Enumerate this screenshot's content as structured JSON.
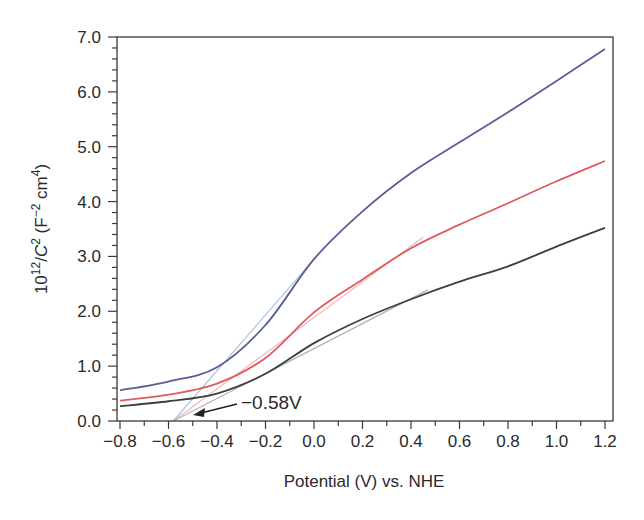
{
  "chart_data": {
    "type": "line",
    "title": "",
    "xlabel": "Potential (V) vs. NHE",
    "ylabel": {
      "base": "10",
      "exp": "12",
      "mid": "/",
      "var": "C",
      "var_exp": "2",
      "units_open": " (F",
      "units_exp1": "−2",
      "units_mid": " cm",
      "units_exp2": "4",
      "units_close": ")"
    },
    "xlim": [
      -0.85,
      1.23
    ],
    "ylim": [
      0.0,
      7.0
    ],
    "x_ticks": [
      -0.8,
      -0.6,
      -0.4,
      -0.2,
      0.0,
      0.2,
      0.4,
      0.6,
      0.8,
      1.0,
      1.2
    ],
    "x_tick_labels": [
      "−0.8",
      "−0.6",
      "−0.4",
      "−0.2",
      "0.0",
      "0.2",
      "0.4",
      "0.6",
      "0.8",
      "1.0",
      "1.2"
    ],
    "x_minor_step": 0.1,
    "y_ticks": [
      0,
      1,
      2,
      3,
      4,
      5,
      6,
      7
    ],
    "y_tick_labels": [
      "0.0",
      "1.0",
      "2.0",
      "3.0",
      "4.0",
      "5.0",
      "6.0",
      "7.0"
    ],
    "y_minor_step": 0.2,
    "grid": false,
    "legend": null,
    "x": [
      -0.8,
      -0.6,
      -0.4,
      -0.2,
      0.0,
      0.2,
      0.4,
      0.6,
      0.8,
      1.0,
      1.2
    ],
    "series": [
      {
        "name": "blue",
        "color": "#5b5c98",
        "values": [
          0.56,
          0.72,
          0.98,
          1.75,
          2.95,
          3.82,
          4.52,
          5.08,
          5.63,
          6.2,
          6.78
        ]
      },
      {
        "name": "red",
        "color": "#e05a5e",
        "values": [
          0.37,
          0.48,
          0.68,
          1.15,
          1.98,
          2.58,
          3.15,
          3.58,
          3.97,
          4.37,
          4.74
        ]
      },
      {
        "name": "dark",
        "color": "#3b403b",
        "values": [
          0.27,
          0.36,
          0.5,
          0.86,
          1.42,
          1.86,
          2.22,
          2.54,
          2.82,
          3.18,
          3.52
        ]
      }
    ],
    "fit_lines": [
      {
        "name": "blue-fit",
        "color": "#a9c6e0",
        "x": [
          -0.58,
          0.0
        ],
        "y": [
          0.0,
          2.95
        ]
      },
      {
        "name": "red-fit",
        "color": "#f2b6c0",
        "x": [
          -0.58,
          0.45
        ],
        "y": [
          0.0,
          3.35
        ]
      },
      {
        "name": "dark-fit",
        "color": "#a9b8a9",
        "x": [
          -0.58,
          0.47
        ],
        "y": [
          0.0,
          2.39
        ]
      }
    ],
    "annotations": [
      {
        "text": "−0.58V",
        "x": -0.58,
        "y": 0.0,
        "arrow": true
      }
    ]
  }
}
